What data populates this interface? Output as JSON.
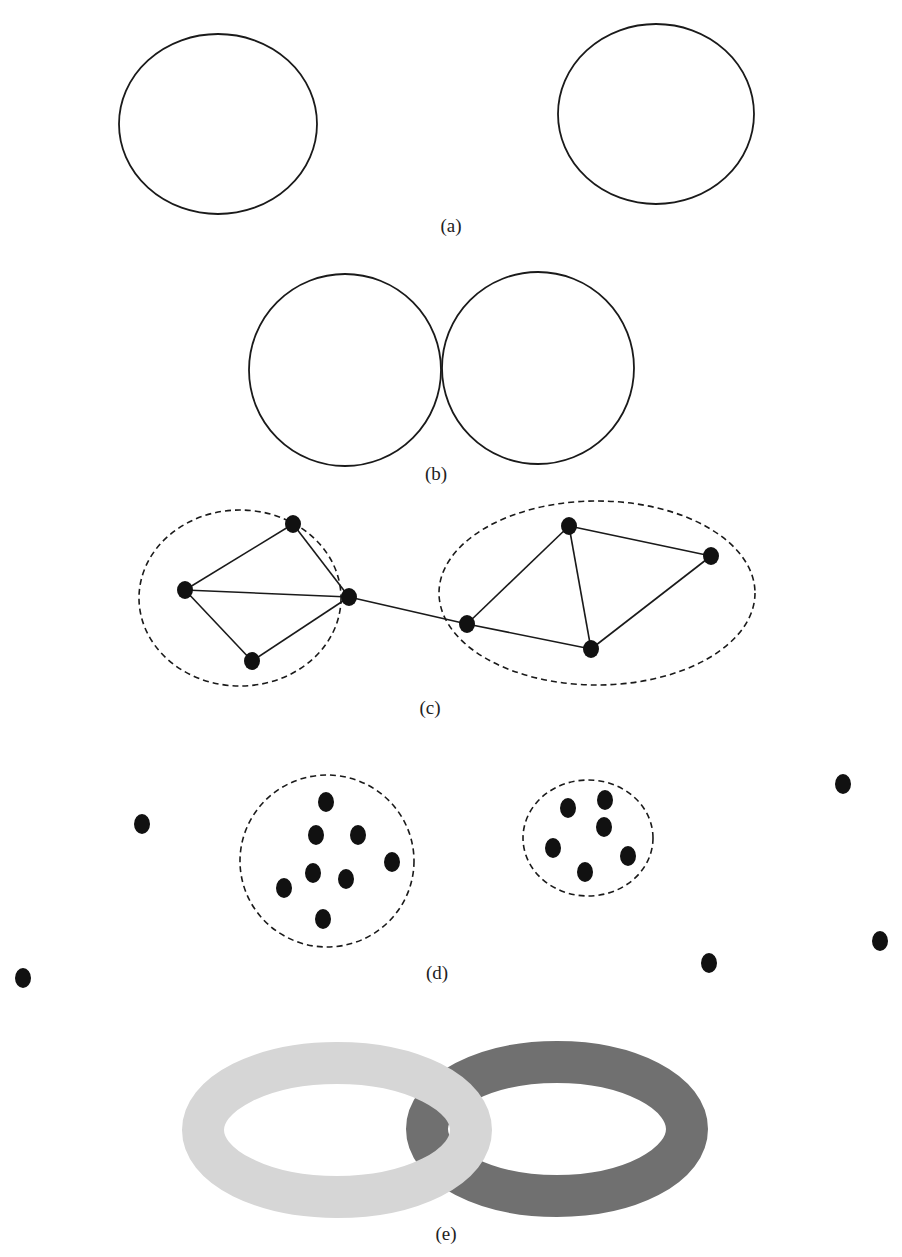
{
  "figure": {
    "panels": [
      {
        "id": "a",
        "caption": "(a)",
        "description": "Two separate circles far apart"
      },
      {
        "id": "b",
        "caption": "(b)",
        "description": "Two circles touching at a single point"
      },
      {
        "id": "c",
        "caption": "(c)",
        "description": "Two dashed-ellipse clusters of connected nodes joined by one edge"
      },
      {
        "id": "d",
        "caption": "(d)",
        "description": "Two dashed-circle clusters of dots with scattered outlier dots"
      },
      {
        "id": "e",
        "caption": "(e)",
        "description": "Two interlocking rings, light gray and dark gray"
      }
    ],
    "colors": {
      "stroke": "#1a1a1a",
      "node": "#111111",
      "ring_light": "#d6d6d6",
      "ring_dark": "#707070"
    }
  }
}
